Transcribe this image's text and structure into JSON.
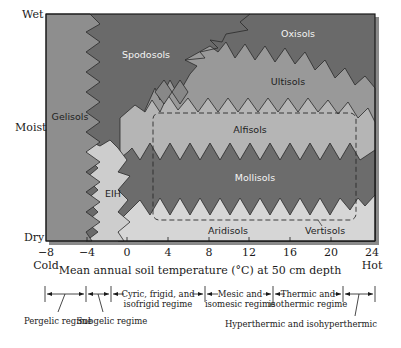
{
  "moisture_axis": {
    "top": "Wet",
    "middle": "Moist",
    "bottom": "Dry"
  },
  "x_axis": {
    "title": "Mean annual soil temperature (°C) at 50 cm depth",
    "ticks": [
      "−8",
      "−4",
      "0",
      "4",
      "8",
      "12",
      "16",
      "20",
      "24"
    ],
    "left_end_label": "Cold",
    "right_end_label": "Hot"
  },
  "soil_orders": {
    "spodosols": "Spodosols",
    "oxisols": "Oxisols",
    "gelisols": "Gelisols",
    "ultisols": "Ultisols",
    "alfisols": "Alfisols",
    "eih": "EIH",
    "mollisols": "Mollisols",
    "aridisols": "Aridisols",
    "vertisols": "Vertisols"
  },
  "regimes": {
    "pergelic": "Pergelic regime",
    "subgelic": "Subgelic regime",
    "cryic_line1": "Cyric, frigid, and",
    "cryic_line2": "isofrigid regime",
    "mesic_line1": "Mesic and",
    "mesic_line2": "isomesic regime",
    "thermic_line1": "Thermic and",
    "thermic_line2": "isothermic regime",
    "hyperthermic": "Hyperthermic and isohyperthermic"
  },
  "colors": {
    "gelisols": "#8e8e8e",
    "spodosols_oxisols_mollisols": "#6a6a6a",
    "ultisols": "#9a9a9a",
    "alfisols": "#b4b4b4",
    "dry_soils": "#d4d4d4",
    "border": "#1a1a1a",
    "shadow": "#7a7a7a"
  }
}
